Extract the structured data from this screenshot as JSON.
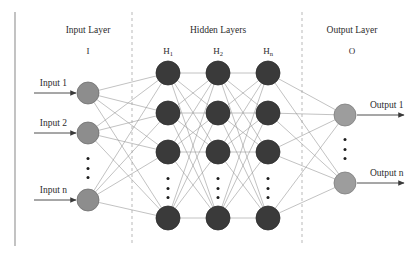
{
  "figure": {
    "type": "neural-network-diagram",
    "width": 418,
    "height": 258,
    "background": "#ffffff",
    "border_line_color": "#9a9a9a",
    "divider_color": "#b9b9b9",
    "edge_color": "#8f8f8f",
    "arrow_color": "#3a3a3a"
  },
  "sections": {
    "input": {
      "title": "Input Layer",
      "symbol": "I",
      "title_x": 88,
      "title_y": 26,
      "sub_y": 47
    },
    "hidden": {
      "title": "Hidden Layers",
      "title_x": 218,
      "title_y": 26,
      "sub_y": 47,
      "columns": [
        {
          "symbol": "H",
          "subscript": "1",
          "x": 168
        },
        {
          "symbol": "H",
          "subscript": "2",
          "x": 218
        },
        {
          "symbol": "H",
          "subscript": "n",
          "x": 268
        }
      ]
    },
    "output": {
      "title": "Output Layer",
      "symbol": "O",
      "title_x": 352,
      "title_y": 26,
      "sub_y": 47
    }
  },
  "dividers": [
    {
      "x": 132,
      "y1": 12,
      "y2": 246
    },
    {
      "x": 302,
      "y1": 12,
      "y2": 246
    }
  ],
  "frame_line": {
    "x": 15,
    "y1": 12,
    "y2": 246
  },
  "layers": {
    "input": {
      "node_x": 88,
      "radius": 11,
      "fill": "#8d8d8d",
      "stroke": "#6f6f6f",
      "nodes": [
        {
          "y": 93,
          "label": "Input 1"
        },
        {
          "y": 133,
          "label": "Input 2"
        },
        {
          "y": 200,
          "label": "Input n"
        }
      ],
      "ellipsis": {
        "x": 88,
        "y": 168,
        "dots": 3
      },
      "arrow": {
        "x_start": 34,
        "label_dx": -6,
        "label_dy": -9
      }
    },
    "hidden": {
      "radius": 12,
      "fill": "#3a3a3a",
      "stroke": "#2d2d2d",
      "columns_x": [
        168,
        218,
        268
      ],
      "rows_y": [
        73,
        113,
        152,
        218
      ],
      "ellipsis_y": 188,
      "ellipsis_dots": 3
    },
    "output": {
      "node_x": 345,
      "radius": 11,
      "fill": "#9d9d9d",
      "stroke": "#7d7d7d",
      "nodes": [
        {
          "y": 115,
          "label": "Output 1"
        },
        {
          "y": 183,
          "label": "Output n"
        }
      ],
      "ellipsis": {
        "x": 345,
        "y": 149,
        "dots": 3
      },
      "arrow": {
        "x_end": 404,
        "label_dx": 14,
        "label_dy": -9
      }
    }
  }
}
